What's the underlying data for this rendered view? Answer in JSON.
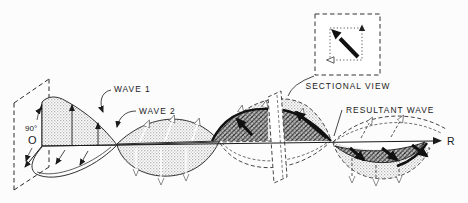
{
  "figure": {
    "type": "wave-polarization-diagram",
    "labels": {
      "wave1": "WAVE 1",
      "wave2": "WAVE 2",
      "resultant_wave": "RESULTANT WAVE",
      "sectional_view": "SECTIONAL VIEW",
      "angle": "90°",
      "origin": "O",
      "propagation": "R"
    },
    "colors": {
      "ink": "#1b1b1b",
      "halftone_light": "#d4d4d4",
      "halftone_dark": "#8c8c8c",
      "paper": "#fcfcfc"
    }
  }
}
